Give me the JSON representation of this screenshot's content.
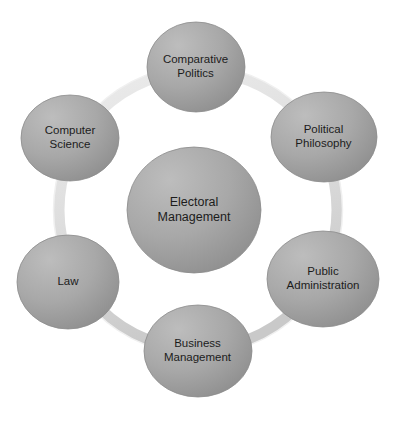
{
  "diagram": {
    "type": "hub-and-spoke circle diagram",
    "colors": {
      "background": "#ffffff",
      "node_fill_light": "#b2b2b2",
      "node_fill_dark": "#969696",
      "node_stroke": "#8c8c8c",
      "ring_color": "#e2e2e2",
      "ring_shadow": "#cfcfcf",
      "text_color": "#1c1c1c"
    },
    "ring": {
      "center_x": 198,
      "center_y": 210,
      "radius": 139,
      "thickness": 11
    },
    "center_node": {
      "id": "electoral-management",
      "label": "Electoral\nManagement",
      "cx": 194,
      "cy": 210,
      "rx": 67,
      "ry": 63
    },
    "satellites": [
      {
        "id": "comparative-politics",
        "label": "Comparative\nPolitics",
        "cx": 196,
        "cy": 67,
        "rx": 49,
        "ry": 45,
        "position": "top"
      },
      {
        "id": "political-philosophy",
        "label": "Political\nPhilosophy",
        "cx": 324,
        "cy": 137,
        "rx": 53,
        "ry": 45,
        "position": "top-right"
      },
      {
        "id": "public-administration",
        "label": "Public\nAdministration",
        "cx": 323,
        "cy": 279,
        "rx": 56,
        "ry": 48,
        "position": "bottom-right"
      },
      {
        "id": "business-management",
        "label": "Business\nManagement",
        "cx": 198,
        "cy": 351,
        "rx": 54,
        "ry": 46,
        "position": "bottom"
      },
      {
        "id": "law",
        "label": "Law",
        "cx": 68,
        "cy": 282,
        "rx": 51,
        "ry": 47,
        "position": "bottom-left"
      },
      {
        "id": "computer-science",
        "label": "Computer\nScience",
        "cx": 70,
        "cy": 138,
        "rx": 49,
        "ry": 43,
        "position": "top-left"
      }
    ]
  }
}
